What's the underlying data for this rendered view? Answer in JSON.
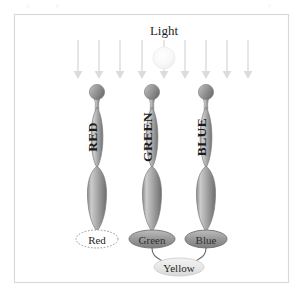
{
  "figure": {
    "name": "trichromatic-color-vision-diagram",
    "frame": {
      "x": 14,
      "y": 14,
      "width": 275,
      "height": 269,
      "border_color": "#d8d8d8",
      "background_color": "#ffffff"
    },
    "light": {
      "label": "Light",
      "label_x": 164,
      "label_y": 31,
      "bulb": {
        "cx": 164,
        "cy": 58,
        "r": 11,
        "color": "#f7f7f7"
      },
      "arrow_count": 9,
      "arrow_color": "#e0e0e0",
      "arrow_xs": [
        78,
        99,
        120,
        142,
        164,
        185,
        206,
        227,
        248
      ],
      "arrow_top_y": 40,
      "arrow_bottom_y": 79
    },
    "cones": [
      {
        "id": "red-cone",
        "label": "RED",
        "cx": 97,
        "ball_cy": 92,
        "ball_r": 7.5,
        "mid_cy": 137,
        "base_cy": 194,
        "output_label": "Red",
        "output_style": "dotted-outline",
        "stimulated": false
      },
      {
        "id": "green-cone",
        "label": "GREEN",
        "cx": 152,
        "ball_cy": 92,
        "ball_r": 7.5,
        "mid_cy": 137,
        "base_cy": 194,
        "output_label": "Green",
        "output_style": "filled",
        "stimulated": true
      },
      {
        "id": "blue-cone",
        "label": "BLUE",
        "cx": 206,
        "ball_cy": 92,
        "ball_r": 7.5,
        "mid_cy": 137,
        "base_cy": 194,
        "output_label": "Blue",
        "output_style": "filled",
        "stimulated": true
      }
    ],
    "outputs": [
      {
        "id": "output-red",
        "label": "Red",
        "cx": 97,
        "cy": 239,
        "rx": 21,
        "ry": 9,
        "style": "dotted-outline"
      },
      {
        "id": "output-green",
        "label": "Green",
        "cx": 152,
        "cy": 239,
        "rx": 23,
        "ry": 9,
        "style": "filled"
      },
      {
        "id": "output-blue",
        "label": "Blue",
        "cx": 206,
        "cy": 239,
        "rx": 21,
        "ry": 9,
        "style": "filled"
      }
    ],
    "result": {
      "id": "result-yellow",
      "label": "Yellow",
      "cx": 179,
      "cy": 267,
      "rx": 25,
      "ry": 9,
      "style": "light-filled"
    },
    "connectors": [
      {
        "from": "output-green",
        "to": "result-yellow"
      },
      {
        "from": "output-blue",
        "to": "result-yellow"
      }
    ],
    "colors": {
      "cone_body": "#9a9a9a",
      "cone_highlight": "#d6d6d6",
      "cone_shadow": "#6e6e6e",
      "pill_fill": "#9c9c9c",
      "yellow_fill": "#ededed",
      "arrow": "#e0e0e0",
      "text": "#1f1f1f"
    }
  }
}
